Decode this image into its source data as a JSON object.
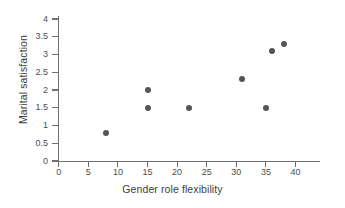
{
  "chart_data": {
    "type": "scatter",
    "title": "",
    "xlabel": "Gender role flexibility",
    "ylabel": "Marital satisfaction",
    "xlim": [
      0,
      41
    ],
    "ylim": [
      0,
      4.2
    ],
    "xticks": [
      0,
      5,
      10,
      15,
      20,
      25,
      30,
      35,
      40
    ],
    "xtick_labels": [
      "0",
      "5",
      "10",
      "15",
      "20",
      "25",
      "30",
      "35",
      "40"
    ],
    "yticks": [
      0,
      0.5,
      1,
      1.5,
      2,
      2.5,
      3,
      3.5,
      4
    ],
    "ytick_labels": [
      "0",
      "0.5",
      "1",
      "1.5",
      "2",
      "2.5",
      "3",
      "3.5",
      "4"
    ],
    "grid": false,
    "legend": null,
    "marker_color": "#555555",
    "axis_color": "#6f6f6f",
    "points": [
      {
        "x": 8,
        "y": 0.8
      },
      {
        "x": 15,
        "y": 2.0
      },
      {
        "x": 15,
        "y": 1.5
      },
      {
        "x": 22,
        "y": 1.5
      },
      {
        "x": 31,
        "y": 2.3
      },
      {
        "x": 35,
        "y": 1.5
      },
      {
        "x": 36,
        "y": 3.1
      },
      {
        "x": 38,
        "y": 3.3
      }
    ]
  }
}
